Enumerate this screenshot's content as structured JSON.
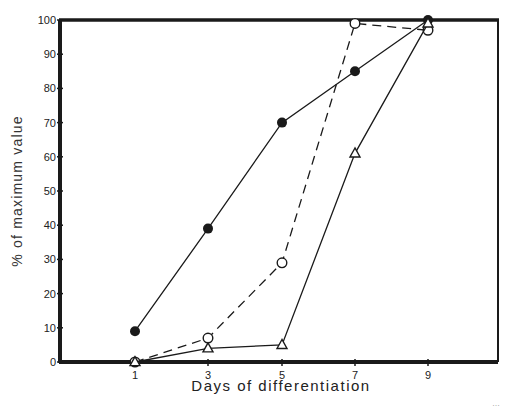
{
  "chart_data": {
    "type": "line",
    "title": "",
    "xlabel": "Days of differentiation",
    "ylabel": "% of maximum value",
    "x": [
      1,
      3,
      5,
      7,
      9
    ],
    "x_ticks": [
      "1",
      "3",
      "5",
      "7",
      "9"
    ],
    "y_ticks": [
      "0",
      "10",
      "20",
      "30",
      "40",
      "50",
      "60",
      "70",
      "80",
      "90",
      "100"
    ],
    "ylim": [
      0,
      100
    ],
    "grid": false,
    "legend": null,
    "series": [
      {
        "name": "filled circles",
        "marker": "filled-circle",
        "line": "solid",
        "values": [
          9,
          39,
          70,
          85,
          100
        ]
      },
      {
        "name": "open circles",
        "marker": "open-circle",
        "line": "dashed",
        "values": [
          0,
          7,
          29,
          99,
          97
        ]
      },
      {
        "name": "open triangles",
        "marker": "open-triangle",
        "line": "solid",
        "values": [
          0,
          4,
          5,
          61,
          99
        ]
      }
    ],
    "caption_fragment": "(illegible cropped caption text)"
  },
  "layout": {
    "plot_left": 60,
    "plot_right": 498,
    "plot_top": 20,
    "plot_bottom": 362,
    "x_positions": {
      "1": 135,
      "3": 208,
      "5": 282,
      "7": 355,
      "9": 428
    },
    "ink_color": "#1a1a1a"
  }
}
